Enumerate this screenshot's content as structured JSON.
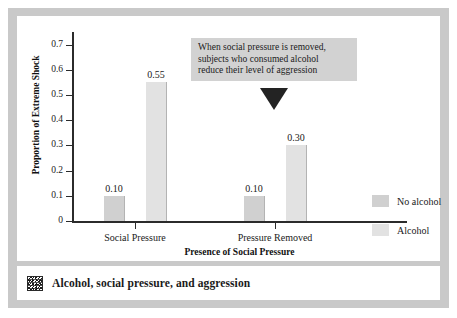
{
  "figure": {
    "caption": "Alcohol, social pressure, and aggression",
    "caption_icon": "mosaic-thumbnail-icon",
    "frame_color": "#c9c9c9",
    "panel_color": "#ffffff"
  },
  "annotation": {
    "line1": "When social pressure is removed,",
    "line2": "subjects who consumed alcohol",
    "line3": "reduce their level of aggression",
    "background": "#d2d2d2",
    "pointer": "down-triangle",
    "pointer_color": "#232323"
  },
  "legend": {
    "position": "right",
    "items": [
      {
        "label": "No alcohol",
        "color": "#d0d0d0"
      },
      {
        "label": "Alcohol",
        "color": "#e2e2e2"
      }
    ]
  },
  "chart_data": {
    "type": "bar",
    "title": "",
    "xlabel": "Presence of Social Pressure",
    "ylabel": "Proportion of Extreme Shock",
    "categories": [
      "Social Pressure",
      "Pressure Removed"
    ],
    "series": [
      {
        "name": "No alcohol",
        "values": [
          0.1,
          0.1
        ],
        "labels": [
          "0.10",
          "0.10"
        ],
        "color": "#d0d0d0"
      },
      {
        "name": "Alcohol",
        "values": [
          0.55,
          0.3
        ],
        "labels": [
          "0.55",
          "0.30"
        ],
        "color": "#e2e2e2"
      }
    ],
    "ylim": [
      0,
      0.75
    ],
    "yticks": [
      0,
      0.1,
      0.2,
      0.3,
      0.4,
      0.5,
      0.6,
      0.7
    ],
    "ytick_labels": [
      "0",
      "0.1",
      "0.2",
      "0.3",
      "0.4",
      "0.5",
      "0.6",
      "0.7"
    ],
    "grid": false,
    "legend_position": "right"
  }
}
